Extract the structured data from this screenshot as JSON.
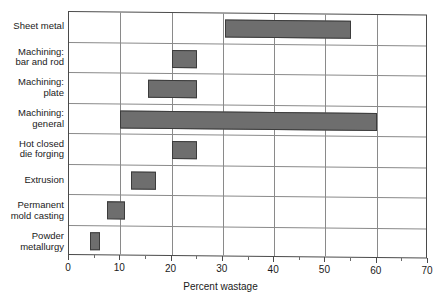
{
  "chart_data": {
    "type": "bar",
    "orientation": "horizontal",
    "subtype": "floating-range-bar",
    "title": "",
    "xlabel": "Percent wastage",
    "ylabel": "",
    "xlim": [
      0,
      70
    ],
    "xticks": [
      0,
      10,
      20,
      30,
      40,
      50,
      60,
      70
    ],
    "xticklabels": [
      "0",
      "10",
      "20",
      "30",
      "40",
      "50",
      "60",
      "70"
    ],
    "grid": "vertical",
    "legend": "none",
    "bar_color": "#6e6e6e",
    "bar_edge_color": "#3c3c3c",
    "categories": [
      "Sheet metal",
      "Machining: bar and rod",
      "Machining: plate",
      "Machining: general",
      "Hot closed die forging",
      "Extrusion",
      "Permanent mold casting",
      "Powder metallurgy"
    ],
    "category_label_lines": [
      [
        "Sheet metal"
      ],
      [
        "Machining:",
        "bar and rod"
      ],
      [
        "Machining:",
        "plate"
      ],
      [
        "Machining:",
        "general"
      ],
      [
        "Hot closed",
        "die forging"
      ],
      [
        "Extrusion"
      ],
      [
        "Permanent",
        "mold casting"
      ],
      [
        "Powder",
        "metallurgy"
      ]
    ],
    "ranges": [
      {
        "category": "Sheet metal",
        "low": 30.5,
        "high": 55.0
      },
      {
        "category": "Machining: bar and rod",
        "low": 20.0,
        "high": 25.0
      },
      {
        "category": "Machining: plate",
        "low": 15.5,
        "high": 25.0
      },
      {
        "category": "Machining: general",
        "low": 10.0,
        "high": 60.0
      },
      {
        "category": "Hot closed die forging",
        "low": 20.0,
        "high": 25.0
      },
      {
        "category": "Extrusion",
        "low": 12.0,
        "high": 17.0
      },
      {
        "category": "Permanent mold casting",
        "low": 7.5,
        "high": 11.0
      },
      {
        "category": "Powder metallurgy",
        "low": 4.0,
        "high": 6.0
      }
    ]
  }
}
